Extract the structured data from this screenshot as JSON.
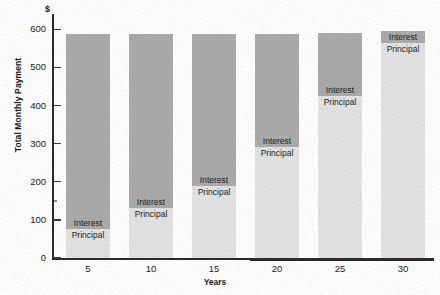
{
  "chart_data": {
    "type": "bar",
    "subtype": "stacked-bar",
    "title": "",
    "xlabel": "Years",
    "ylabel": "Total Monthly Payment",
    "currency_symbol": "$",
    "categories": [
      "5",
      "10",
      "15",
      "20",
      "25",
      "30"
    ],
    "xtick_labels": [
      "5",
      "10",
      "15",
      "20",
      "25",
      "30"
    ],
    "ytick_labels": [
      "0",
      "100",
      "200",
      "300",
      "400",
      "500",
      "600"
    ],
    "ytick_values": [
      0,
      100,
      200,
      300,
      400,
      500,
      600
    ],
    "ylim": [
      0,
      640
    ],
    "grid": false,
    "legend": "in-bar-labels",
    "series": [
      {
        "name": "Principal",
        "label": "Principal",
        "color": "#e3e3e3",
        "values": [
          75,
          130,
          190,
          290,
          425,
          565
        ]
      },
      {
        "name": "Interest",
        "label": "Interest",
        "color": "#ababab",
        "values": [
          513,
          458,
          398,
          298,
          165,
          30
        ]
      }
    ],
    "totals": [
      588,
      588,
      588,
      588,
      590,
      595
    ],
    "bar_labels": {
      "interest": "Interest",
      "principal": "Principal"
    }
  },
  "colors": {
    "interest": "#ababab",
    "principal": "#e3e3e3",
    "axis": "#2b2b2b",
    "text": "#1a1a1a",
    "background": "#ffffff"
  }
}
